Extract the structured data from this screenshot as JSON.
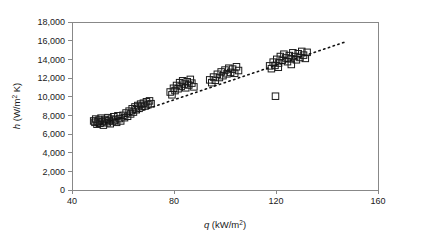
{
  "chart_data": {
    "type": "scatter",
    "title": "",
    "xlabel": "q (kW/m2)",
    "ylabel": "h (W/m2 K)",
    "xlabel_parts": {
      "symbol": "q",
      "unit_pre": " (kW/m",
      "unit_sup": "2",
      "unit_post": ")"
    },
    "ylabel_parts": {
      "symbol": "h",
      "unit_pre": " (W/m",
      "unit_sup": "2",
      "unit_post": " K)"
    },
    "xlim": [
      40,
      160
    ],
    "ylim": [
      0,
      18000
    ],
    "xticks": [
      40,
      80,
      120,
      160
    ],
    "xtick_labels": [
      "40",
      "80",
      "120",
      "160"
    ],
    "yticks": [
      0,
      2000,
      4000,
      6000,
      8000,
      10000,
      12000,
      14000,
      16000,
      18000
    ],
    "ytick_labels": [
      "0",
      "2,000",
      "4,000",
      "6,000",
      "8,000",
      "10,000",
      "12,000",
      "14,000",
      "16,000",
      "18,000"
    ],
    "grid": false,
    "legend": null,
    "marker": {
      "shape": "open-square",
      "size": 6.5,
      "stroke": "#1a1a1a",
      "fill": "none"
    },
    "axis_color": "#888888",
    "series": [
      {
        "name": "measured",
        "marker": "open-square",
        "points": [
          [
            48.5,
            7400
          ],
          [
            49.0,
            7250
          ],
          [
            49.3,
            7600
          ],
          [
            49.8,
            7050
          ],
          [
            50.2,
            7350
          ],
          [
            50.6,
            7500
          ],
          [
            51.0,
            7150
          ],
          [
            51.4,
            7700
          ],
          [
            51.9,
            7300
          ],
          [
            52.3,
            6950
          ],
          [
            52.8,
            7550
          ],
          [
            53.2,
            7400
          ],
          [
            53.8,
            7200
          ],
          [
            54.1,
            7750
          ],
          [
            54.6,
            7450
          ],
          [
            55.0,
            7100
          ],
          [
            55.5,
            7600
          ],
          [
            56.0,
            7350
          ],
          [
            56.4,
            7850
          ],
          [
            57.0,
            7500
          ],
          [
            57.5,
            7250
          ],
          [
            58.0,
            7950
          ],
          [
            58.6,
            7650
          ],
          [
            59.1,
            7400
          ],
          [
            60.0,
            8000
          ],
          [
            60.6,
            7750
          ],
          [
            61.2,
            8250
          ],
          [
            61.8,
            7900
          ],
          [
            62.4,
            8450
          ],
          [
            63.0,
            8150
          ],
          [
            63.6,
            8700
          ],
          [
            64.1,
            8350
          ],
          [
            64.7,
            8900
          ],
          [
            65.2,
            8600
          ],
          [
            65.8,
            9050
          ],
          [
            66.3,
            8750
          ],
          [
            66.9,
            9200
          ],
          [
            67.4,
            8950
          ],
          [
            68.0,
            9300
          ],
          [
            68.6,
            9000
          ],
          [
            69.2,
            9450
          ],
          [
            69.8,
            9150
          ],
          [
            70.4,
            9550
          ],
          [
            71.0,
            9250
          ],
          [
            78.5,
            10500
          ],
          [
            79.2,
            10200
          ],
          [
            79.8,
            10900
          ],
          [
            80.4,
            10650
          ],
          [
            81.0,
            11200
          ],
          [
            81.6,
            10850
          ],
          [
            82.2,
            11500
          ],
          [
            82.8,
            11100
          ],
          [
            83.4,
            11700
          ],
          [
            84.0,
            11350
          ],
          [
            84.6,
            10950
          ],
          [
            85.2,
            11600
          ],
          [
            85.8,
            11250
          ],
          [
            86.4,
            11850
          ],
          [
            87.0,
            11450
          ],
          [
            87.8,
            11050
          ],
          [
            94.0,
            11800
          ],
          [
            94.8,
            11500
          ],
          [
            95.5,
            12100
          ],
          [
            96.2,
            11750
          ],
          [
            97.0,
            12400
          ],
          [
            97.8,
            12050
          ],
          [
            98.5,
            12650
          ],
          [
            99.2,
            12250
          ],
          [
            100.0,
            12850
          ],
          [
            100.8,
            12450
          ],
          [
            101.5,
            13050
          ],
          [
            102.2,
            12600
          ],
          [
            103.0,
            12950
          ],
          [
            103.8,
            12500
          ],
          [
            104.5,
            13200
          ],
          [
            105.3,
            12800
          ],
          [
            119.8,
            10050
          ],
          [
            117.5,
            13300
          ],
          [
            118.2,
            13000
          ],
          [
            118.9,
            13700
          ],
          [
            119.6,
            13350
          ],
          [
            120.3,
            14000
          ],
          [
            121.0,
            13600
          ],
          [
            121.7,
            14300
          ],
          [
            122.4,
            13900
          ],
          [
            123.1,
            14550
          ],
          [
            123.8,
            14150
          ],
          [
            124.5,
            13750
          ],
          [
            125.2,
            14400
          ],
          [
            125.9,
            14050
          ],
          [
            126.6,
            14700
          ],
          [
            127.3,
            14300
          ],
          [
            128.0,
            13950
          ],
          [
            128.7,
            14600
          ],
          [
            129.4,
            14200
          ],
          [
            130.1,
            14850
          ],
          [
            130.8,
            14450
          ],
          [
            131.5,
            14100
          ],
          [
            132.2,
            14750
          ],
          [
            120.9,
            13150
          ],
          [
            126.0,
            13450
          ]
        ]
      }
    ],
    "trend": {
      "name": "linear fit",
      "style": "dotted",
      "x0": 49.5,
      "y0": 6850,
      "x1": 147.0,
      "y1": 15850
    }
  }
}
